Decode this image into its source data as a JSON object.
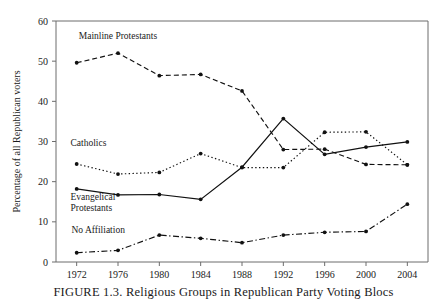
{
  "figure": {
    "caption": "FIGURE 1.3.  Religious Groups in Republican Party Voting Blocs"
  },
  "chart_data": {
    "type": "line",
    "title": "",
    "xlabel": "",
    "ylabel": "Percentage of all Republican voters",
    "categories": [
      "1972",
      "1976",
      "1980",
      "1984",
      "1988",
      "1992",
      "1996",
      "2000",
      "2004"
    ],
    "x": [
      1972,
      1976,
      1980,
      1984,
      1988,
      1992,
      1996,
      2000,
      2004
    ],
    "xlim": [
      1970,
      2006
    ],
    "ylim": [
      0,
      60
    ],
    "yticks": [
      "0",
      "10",
      "20",
      "30",
      "40",
      "50",
      "60"
    ],
    "ytick_values": [
      0,
      10,
      20,
      30,
      40,
      50,
      60
    ],
    "grid": false,
    "legend": "inline-labels",
    "series": [
      {
        "name": "Mainline Protestants",
        "label": "Mainline Protestants",
        "dash": "dashed",
        "color": "#111111",
        "label_x": 1972.2,
        "label_y": 55.4,
        "values": [
          49.6,
          52.0,
          46.4,
          46.7,
          42.6,
          28.0,
          28.1,
          24.3,
          24.2
        ]
      },
      {
        "name": "Catholics",
        "label": "Catholics",
        "dash": "dotted",
        "color": "#111111",
        "label_x": 1971.4,
        "label_y": 28.8,
        "values": [
          24.4,
          21.9,
          22.3,
          27.0,
          23.5,
          23.5,
          32.3,
          32.4,
          24.2
        ]
      },
      {
        "name": "Evangelical Protestants",
        "label": "Evangelical\nProtestants",
        "dash": "solid",
        "color": "#111111",
        "label_x": 1971.4,
        "label_y": 15.5,
        "values": [
          18.2,
          16.7,
          16.8,
          15.6,
          23.6,
          35.7,
          26.8,
          28.6,
          29.9
        ]
      },
      {
        "name": "No Affiliation",
        "label": "No Affiliation",
        "dash": "dashdot",
        "color": "#111111",
        "label_x": 1971.5,
        "label_y": 7.2,
        "values": [
          2.3,
          2.9,
          6.7,
          5.9,
          4.8,
          6.7,
          7.4,
          7.6,
          14.4
        ]
      }
    ]
  }
}
